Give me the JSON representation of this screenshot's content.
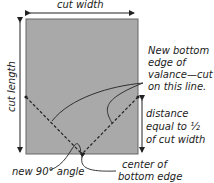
{
  "diagram": {
    "labels": {
      "top": "cut width",
      "left": "cut length",
      "note_line1": "New bottom",
      "note_line2": "edge of",
      "note_line3": "valance—cut",
      "note_line4": "on this line.",
      "distance_line1": "distance",
      "distance_line2": "equal to ½",
      "distance_line3": "of cut width",
      "angle": "new 90° angle",
      "center_line1": "center of",
      "center_line2": "bottom edge"
    },
    "colors": {
      "fabric": "#a9a9a9",
      "line": "#222222"
    }
  }
}
